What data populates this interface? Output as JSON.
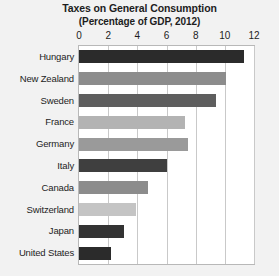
{
  "chart_data": {
    "type": "bar",
    "orientation": "horizontal",
    "title": "Taxes on General Consumption",
    "subtitle": "(Percentage of GDP, 2012)",
    "xlabel": "",
    "ylabel": "",
    "xlim": [
      0,
      12
    ],
    "xticks": [
      "0",
      "2",
      "4",
      "6",
      "8",
      "10",
      "12"
    ],
    "xtick_values": [
      0,
      2,
      4,
      6,
      8,
      10,
      12
    ],
    "grid": true,
    "grid_axis": "x",
    "legend": "none",
    "categories": [
      "Hungary",
      "New Zealand",
      "Sweden",
      "France",
      "Germany",
      "Italy",
      "Canada",
      "Switzerland",
      "Japan",
      "United States"
    ],
    "values": [
      11.3,
      10.1,
      9.4,
      7.3,
      7.5,
      6.0,
      4.7,
      3.9,
      3.1,
      2.2
    ],
    "bar_colors": [
      "#2b2b2b",
      "#8c8c8c",
      "#5e5e5e",
      "#b3b3b3",
      "#9a9a9a",
      "#3f3f3f",
      "#8c8c8c",
      "#c4c4c4",
      "#333333",
      "#2b2b2b"
    ]
  },
  "style": {
    "page_background": "#f2f2f2",
    "plot_background": "#ffffff",
    "grid_color": "#c9c9c9",
    "border_color": "#b8b8b8",
    "text_color": "#1d1d1d"
  }
}
